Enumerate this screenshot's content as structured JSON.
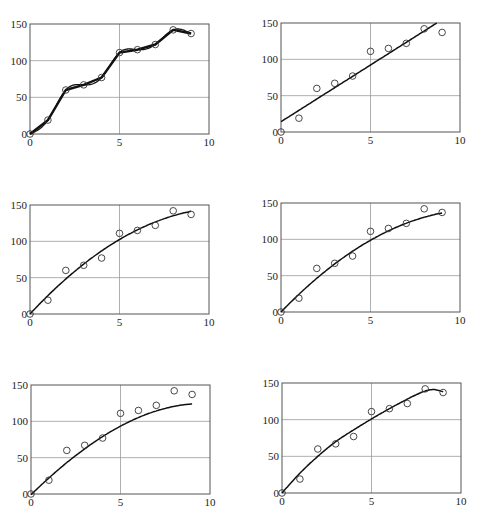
{
  "chart_data": [
    {
      "id": "p1",
      "type": "line",
      "title": "",
      "xlabel": "",
      "ylabel": "",
      "xlim": [
        0,
        10
      ],
      "ylim": [
        0,
        150
      ],
      "xticks": [
        0,
        5,
        10
      ],
      "yticks": [
        0,
        50,
        100,
        150
      ],
      "grid": true,
      "points": {
        "x": [
          0,
          1,
          2,
          3,
          4,
          5,
          6,
          7,
          8,
          9
        ],
        "y": [
          0,
          19,
          60,
          67,
          77,
          111,
          115,
          122,
          142,
          137
        ]
      },
      "fits": [
        {
          "name": "linear interpolation",
          "kind": "polyline",
          "stroke_width": 2.4
        },
        {
          "name": "cubic spline",
          "kind": "spline",
          "stroke_width": 1.3
        }
      ]
    },
    {
      "id": "p2",
      "type": "scatter",
      "title": "",
      "xlim": [
        0,
        10
      ],
      "ylim": [
        0,
        150
      ],
      "xticks": [
        0,
        5,
        10
      ],
      "yticks": [
        0,
        50,
        100,
        150
      ],
      "grid": true,
      "points": {
        "x": [
          0,
          1,
          2,
          3,
          4,
          5,
          6,
          7,
          8,
          9
        ],
        "y": [
          0,
          19,
          60,
          67,
          77,
          111,
          115,
          122,
          142,
          137
        ]
      },
      "fits": [
        {
          "name": "linear fit",
          "kind": "poly",
          "coeffs": [
            14.2,
            15.6
          ],
          "x_range": [
            0,
            8.7
          ],
          "stroke_width": 1.5
        }
      ]
    },
    {
      "id": "p3",
      "type": "scatter",
      "title": "",
      "xlim": [
        0,
        10
      ],
      "ylim": [
        0,
        150
      ],
      "xticks": [
        0,
        5,
        10
      ],
      "yticks": [
        0,
        50,
        100,
        150
      ],
      "grid": true,
      "points": {
        "x": [
          0,
          1,
          2,
          3,
          4,
          5,
          6,
          7,
          8,
          9
        ],
        "y": [
          0,
          19,
          60,
          67,
          77,
          111,
          115,
          122,
          142,
          137
        ]
      },
      "fits": [
        {
          "name": "quadratic fit",
          "kind": "poly",
          "coeffs": [
            0,
            26.5,
            -1.2
          ],
          "x_range": [
            0,
            9
          ],
          "stroke_width": 1.5
        }
      ]
    },
    {
      "id": "p4",
      "type": "scatter",
      "title": "",
      "xlim": [
        0,
        10
      ],
      "ylim": [
        0,
        150
      ],
      "xticks": [
        0,
        5,
        10
      ],
      "yticks": [
        0,
        50,
        100,
        150
      ],
      "grid": true,
      "points": {
        "x": [
          0,
          1,
          2,
          3,
          4,
          5,
          6,
          7,
          8,
          9
        ],
        "y": [
          0,
          19,
          60,
          67,
          77,
          111,
          115,
          122,
          142,
          137
        ]
      },
      "fits": [
        {
          "name": "quadratic fit (alt)",
          "kind": "poly",
          "coeffs": [
            0,
            25.5,
            -1.15
          ],
          "x_range": [
            0,
            9
          ],
          "stroke_width": 1.5
        }
      ]
    },
    {
      "id": "p5",
      "type": "scatter",
      "title": "",
      "xlim": [
        0,
        10
      ],
      "ylim": [
        0,
        150
      ],
      "xticks": [
        0,
        5,
        10
      ],
      "yticks": [
        0,
        50,
        100,
        150
      ],
      "grid": true,
      "points": {
        "x": [
          0,
          1,
          2,
          3,
          4,
          5,
          6,
          7,
          8,
          9
        ],
        "y": [
          0,
          19,
          60,
          67,
          77,
          111,
          115,
          122,
          142,
          137
        ]
      },
      "fits": [
        {
          "name": "cubic fit",
          "kind": "poly",
          "coeffs": [
            -1,
            24,
            -0.9,
            -0.025
          ],
          "x_range": [
            0,
            9
          ],
          "stroke_width": 1.5
        }
      ]
    },
    {
      "id": "p6",
      "type": "scatter",
      "title": "",
      "xlim": [
        0,
        10
      ],
      "ylim": [
        0,
        150
      ],
      "xticks": [
        0,
        5,
        10
      ],
      "yticks": [
        0,
        50,
        100,
        150
      ],
      "grid": true,
      "points": {
        "x": [
          0,
          1,
          2,
          3,
          4,
          5,
          6,
          7,
          8,
          9
        ],
        "y": [
          0,
          19,
          60,
          67,
          77,
          111,
          115,
          122,
          142,
          137
        ]
      },
      "fits": [
        {
          "name": "higher-order fit",
          "kind": "interp",
          "curve_x": [
            0,
            1,
            2,
            3,
            4,
            5,
            6,
            7,
            8,
            8.5,
            9
          ],
          "curve_y": [
            0,
            27,
            50,
            70,
            86,
            101,
            115,
            128,
            139,
            141,
            138
          ],
          "x_range": [
            0,
            9
          ],
          "stroke_width": 1.5
        }
      ]
    }
  ],
  "layout": {
    "panels": [
      {
        "id": "p1",
        "left": 30,
        "top": 24,
        "right": 209,
        "bottom": 134
      },
      {
        "id": "p2",
        "left": 281,
        "top": 23,
        "right": 460,
        "bottom": 132
      },
      {
        "id": "p3",
        "left": 30,
        "top": 205,
        "right": 209,
        "bottom": 314
      },
      {
        "id": "p4",
        "left": 281,
        "top": 203,
        "right": 460,
        "bottom": 312
      },
      {
        "id": "p5",
        "left": 31,
        "top": 385,
        "right": 210,
        "bottom": 494
      },
      {
        "id": "p6",
        "left": 282,
        "top": 383,
        "right": 461,
        "bottom": 493
      }
    ]
  },
  "colors": {
    "axis": "#555555",
    "grid": "#9a9a9a",
    "curve": "#111111",
    "marker": "#333333",
    "text": "#222222"
  }
}
